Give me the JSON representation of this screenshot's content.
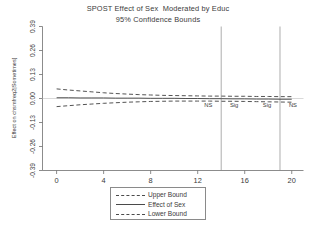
{
  "chart_data": {
    "type": "line",
    "title": "SPOST Effect of Sex  Moderated by Educ",
    "subtitle": "95% Confidence Bounds",
    "xlabel": "Educ",
    "ylabel": "Effect on chsmfreq2|Sometimes]",
    "xlim": [
      -1.2,
      21.0
    ],
    "ylim": [
      -0.39,
      0.39
    ],
    "xticks": [
      0,
      4,
      8,
      12,
      16,
      20
    ],
    "xtick_labels": [
      "0",
      "4",
      "8",
      "12",
      "16",
      "20"
    ],
    "yticks": [
      0.39,
      0.26,
      0.13,
      0.0,
      -0.13,
      -0.26,
      -0.39
    ],
    "ytick_labels": [
      "0.39",
      "0.26",
      "0.13",
      "0.00",
      "-0.13",
      "-0.26",
      "-0.39"
    ],
    "grid": false,
    "legend_position": "below-axis-center",
    "zero_reference_line": 0.0,
    "x": [
      0,
      1,
      2,
      3,
      4,
      5,
      6,
      7,
      8,
      9,
      10,
      11,
      12,
      13,
      14,
      15,
      16,
      17,
      18,
      19,
      20
    ],
    "series": [
      {
        "name": "Upper Bound",
        "style": "dashed",
        "values": [
          0.052,
          0.046,
          0.041,
          0.036,
          0.031,
          0.027,
          0.024,
          0.021,
          0.019,
          0.017,
          0.016,
          0.015,
          0.014,
          0.013,
          0.013,
          0.012,
          0.012,
          0.011,
          0.011,
          0.01,
          0.01
        ]
      },
      {
        "name": "Effect of Sex",
        "style": "solid",
        "values": [
          0.004,
          0.004,
          0.003,
          0.003,
          0.003,
          0.002,
          0.002,
          0.002,
          0.001,
          0.001,
          0.001,
          0.0,
          0.0,
          -0.001,
          -0.001,
          -0.002,
          -0.002,
          -0.003,
          -0.003,
          -0.004,
          -0.004
        ]
      },
      {
        "name": "Lower Bound",
        "style": "dashed",
        "values": [
          -0.044,
          -0.039,
          -0.034,
          -0.03,
          -0.026,
          -0.023,
          -0.02,
          -0.018,
          -0.016,
          -0.015,
          -0.014,
          -0.014,
          -0.014,
          -0.014,
          -0.015,
          -0.015,
          -0.016,
          -0.017,
          -0.018,
          -0.019,
          -0.02
        ]
      }
    ],
    "reference_lines": [
      {
        "name": "boundary-1",
        "x": 14.0
      },
      {
        "name": "boundary-2",
        "x": 19.0
      }
    ],
    "annotations": [
      {
        "name": "ns-left",
        "text": "NS",
        "x": 12.9,
        "y": -0.035
      },
      {
        "name": "sig-left",
        "text": "Sig",
        "x": 15.1,
        "y": -0.035
      },
      {
        "name": "sig-right",
        "text": "Sig",
        "x": 17.9,
        "y": -0.035
      },
      {
        "name": "ns-right",
        "text": "NS",
        "x": 20.1,
        "y": -0.035
      }
    ]
  },
  "legend": {
    "items": [
      {
        "label": "Upper Bound",
        "style": "dashed"
      },
      {
        "label": "Effect of Sex",
        "style": "solid"
      },
      {
        "label": "Lower Bound",
        "style": "dashed"
      }
    ]
  }
}
